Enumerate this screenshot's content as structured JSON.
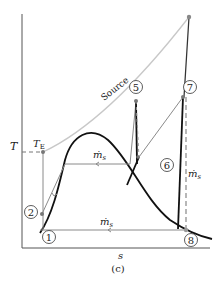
{
  "figure": {
    "caption": "(c)",
    "axes": {
      "ylabel": "T",
      "xlabel": "s"
    },
    "labels": {
      "te_main": "T",
      "te_sub": "E",
      "source": "Source",
      "mdot_top": "ṁ",
      "mdot_top_sub": "s",
      "mdot_right": "ṁ",
      "mdot_right_sub": "s",
      "mdot_bottom": "ṁ",
      "mdot_bottom_sub": "s"
    },
    "states": [
      {
        "id": "1",
        "label": "1"
      },
      {
        "id": "2",
        "label": "2"
      },
      {
        "id": "5",
        "label": "5"
      },
      {
        "id": "6",
        "label": "6"
      },
      {
        "id": "7",
        "label": "7"
      },
      {
        "id": "8",
        "label": "8"
      }
    ],
    "colors": {
      "axis": "#555555",
      "dome": "#111111",
      "source": "#c8c8c8",
      "process": "#8a8a8a",
      "point": "#7a7a7a"
    }
  }
}
